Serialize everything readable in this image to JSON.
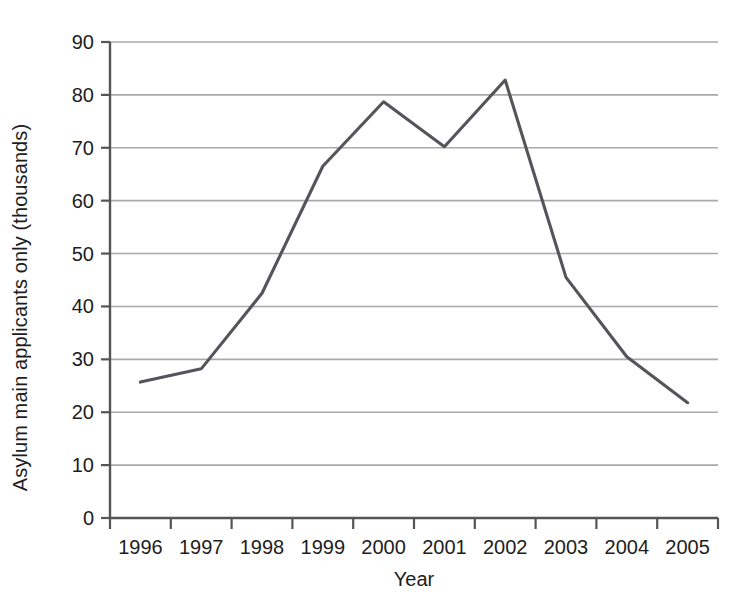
{
  "chart_data": {
    "type": "line",
    "title": "",
    "xlabel": "Year",
    "ylabel": "Asylum main applicants only (thousands)",
    "categories": [
      "1996",
      "1997",
      "1998",
      "1999",
      "2000",
      "2001",
      "2002",
      "2003",
      "2004",
      "2005"
    ],
    "values": [
      25.7,
      28.2,
      42.5,
      66.5,
      78.7,
      70.2,
      82.8,
      45.5,
      30.5,
      21.8
    ],
    "series": [
      {
        "name": "Asylum main applicants only (thousands)",
        "values": [
          25.7,
          28.2,
          42.5,
          66.5,
          78.7,
          70.2,
          82.8,
          45.5,
          30.5,
          21.8
        ]
      }
    ],
    "ylim": [
      0,
      90
    ],
    "yticks": [
      0,
      10,
      20,
      30,
      40,
      50,
      60,
      70,
      80,
      90
    ],
    "ytick_labels": [
      "0",
      "10",
      "20",
      "30",
      "40",
      "50",
      "60",
      "70",
      "80",
      "90"
    ],
    "xtick_labels": [
      "1996",
      "1997",
      "1998",
      "1999",
      "2000",
      "2001",
      "2002",
      "2003",
      "2004",
      "2005"
    ],
    "grid": true,
    "grid_axis": "y",
    "legend": false,
    "legend_position": "none",
    "line_color": "#54545a",
    "grid_color": "#a9a9a9",
    "axis_color": "#555558",
    "text_color": "#1d1d1d",
    "background": "#ffffff",
    "annotations": []
  },
  "axes": {
    "y_title": "Asylum main applicants only (thousands)",
    "x_title": "Year"
  }
}
